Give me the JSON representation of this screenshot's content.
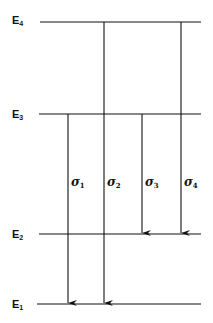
{
  "diagram": {
    "type": "energy-level-diagram",
    "levels": [
      {
        "id": "E4",
        "letter": "E",
        "sub": "4",
        "y": 22
      },
      {
        "id": "E3",
        "letter": "E",
        "sub": "3",
        "y": 114
      },
      {
        "id": "E2",
        "letter": "E",
        "sub": "2",
        "y": 234
      },
      {
        "id": "E1",
        "letter": "E",
        "sub": "1",
        "y": 304
      }
    ],
    "transitions": [
      {
        "id": "sigma1",
        "symbol": "σ",
        "sub": "1",
        "from": "E3",
        "to": "E1"
      },
      {
        "id": "sigma2",
        "symbol": "σ",
        "sub": "2",
        "from": "E4",
        "to": "E1"
      },
      {
        "id": "sigma3",
        "symbol": "σ",
        "sub": "3",
        "from": "E3",
        "to": "E2"
      },
      {
        "id": "sigma4",
        "symbol": "σ",
        "sub": "4",
        "from": "E4",
        "to": "E2"
      }
    ],
    "line_color": "#111111",
    "background": "#ffffff"
  }
}
